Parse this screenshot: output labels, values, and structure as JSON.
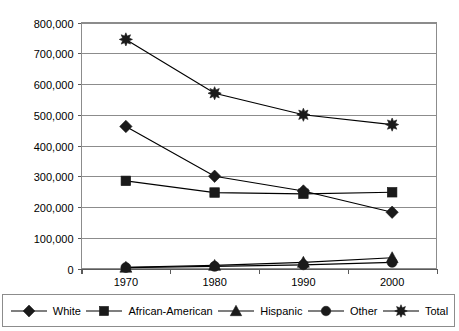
{
  "chart_data": {
    "type": "line",
    "title": "",
    "xlabel": "",
    "ylabel": "",
    "categories": [
      "1970",
      "1980",
      "1990",
      "2000"
    ],
    "ylim": [
      0,
      800000
    ],
    "yticks": [
      0,
      100000,
      200000,
      300000,
      400000,
      500000,
      600000,
      700000,
      800000
    ],
    "ytick_labels": [
      "0",
      "100,000",
      "200,000",
      "300,000",
      "400,000",
      "500,000",
      "600,000",
      "700,000",
      "800,000"
    ],
    "grid": true,
    "legend_position": "bottom",
    "series": [
      {
        "name": "White",
        "marker": "diamond",
        "values": [
          462000,
          300000,
          252000,
          183000
        ]
      },
      {
        "name": "African-American",
        "marker": "square",
        "values": [
          285000,
          247000,
          243000,
          248000
        ]
      },
      {
        "name": "Hispanic",
        "marker": "triangle",
        "values": [
          4000,
          10000,
          20000,
          35000
        ]
      },
      {
        "name": "Other",
        "marker": "circle",
        "values": [
          3000,
          7000,
          12000,
          20000
        ]
      },
      {
        "name": "Total",
        "marker": "star",
        "values": [
          745000,
          570000,
          500000,
          468000
        ]
      }
    ]
  },
  "colors": {
    "series": "#1a1a1a",
    "grid": "#8c8c8c",
    "axis": "#5a5a5a",
    "background": "#ffffff"
  }
}
